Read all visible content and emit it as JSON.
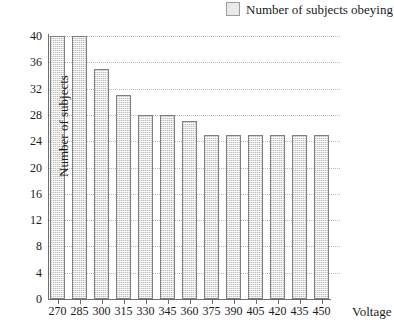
{
  "legend": {
    "swatch_icon": "legend-swatch-icon",
    "label": "Number of subjects obeying",
    "position": "top-right",
    "swatch_color": "#e9e9e9",
    "swatch_border_color": "#9a9a9a"
  },
  "chart_data": {
    "type": "bar",
    "title": "",
    "subtitle": "",
    "xlabel": "Voltage",
    "ylabel": "Number of subjects",
    "categories": [
      "270",
      "285",
      "300",
      "315",
      "330",
      "345",
      "360",
      "375",
      "390",
      "405",
      "420",
      "435",
      "450"
    ],
    "values": [
      40,
      40,
      35,
      31,
      28,
      28,
      27,
      25,
      25,
      25,
      25,
      25,
      25
    ],
    "series": [
      {
        "name": "Number of subjects obeying",
        "values": [
          40,
          40,
          35,
          31,
          28,
          28,
          27,
          25,
          25,
          25,
          25,
          25,
          25
        ]
      }
    ],
    "ylim": [
      0,
      40
    ],
    "yticks": [
      0,
      4,
      8,
      12,
      16,
      20,
      24,
      28,
      32,
      36,
      40
    ],
    "ytick_labels": [
      "0",
      "4",
      "8",
      "12",
      "16",
      "20",
      "24",
      "28",
      "32",
      "36",
      "40"
    ],
    "grid": true,
    "grid_axis": "y",
    "grid_style": "dotted",
    "legend_position": "top-right",
    "bar_fill_color": "#e4e4e4",
    "bar_border_color": "#808080",
    "axis_color": "#6e6e6e"
  }
}
